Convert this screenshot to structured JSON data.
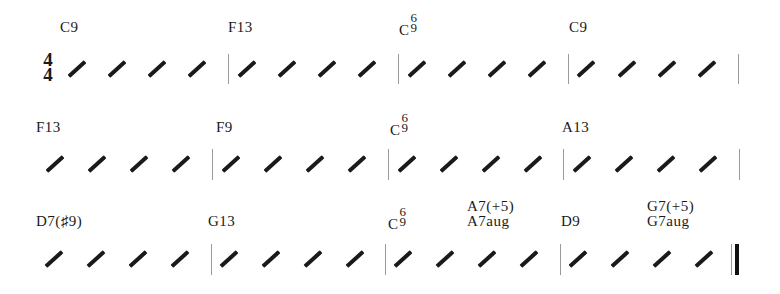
{
  "sheet": {
    "time_signature": {
      "top": "4",
      "bottom": "4"
    },
    "rows": [
      {
        "measures": [
          {
            "chord": "C9",
            "beats": 4
          },
          {
            "chord": "F13",
            "beats": 4
          },
          {
            "chord_root": "C",
            "chord_sup": "6",
            "chord_sub": "9",
            "beats": 4
          },
          {
            "chord": "C9",
            "beats": 4
          }
        ]
      },
      {
        "measures": [
          {
            "chord": "F13",
            "beats": 4
          },
          {
            "chord": "F9",
            "beats": 4
          },
          {
            "chord_root": "C",
            "chord_sup": "6",
            "chord_sub": "9",
            "beats": 4
          },
          {
            "chord": "A13",
            "beats": 4
          }
        ]
      },
      {
        "measures": [
          {
            "chord": "D7(♯9)",
            "beats": 4
          },
          {
            "chord": "G13",
            "beats": 4
          },
          {
            "chord_root": "C",
            "chord_sup": "6",
            "chord_sub": "9",
            "second_chord": "A7(+5)",
            "second_chord_alt": "A7aug",
            "beats": 4
          },
          {
            "chord": "D9",
            "second_chord": "G7(+5)",
            "second_chord_alt": "G7aug",
            "beats": 4
          }
        ],
        "final_barline": true
      }
    ]
  }
}
